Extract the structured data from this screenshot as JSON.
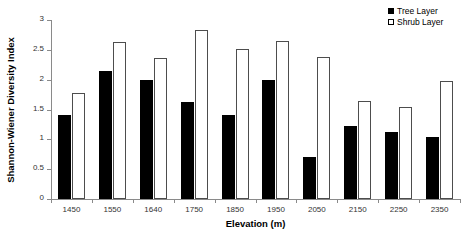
{
  "chart_data": {
    "type": "bar",
    "title": "",
    "xlabel": "Elevation (m)",
    "ylabel": "Shannon-Wiener Diversity Index",
    "categories": [
      "1450",
      "1550",
      "1640",
      "1750",
      "1850",
      "1950",
      "2050",
      "2150",
      "2250",
      "2350"
    ],
    "series": [
      {
        "name": "Tree Layer",
        "color": "#000000",
        "fill": "solid",
        "values": [
          1.4,
          2.15,
          2.0,
          1.62,
          1.4,
          2.0,
          0.71,
          1.23,
          1.12,
          1.04
        ]
      },
      {
        "name": "Shrub Layer",
        "color": "#ffffff",
        "fill": "open",
        "values": [
          1.77,
          2.63,
          2.36,
          2.83,
          2.51,
          2.65,
          2.38,
          1.64,
          1.55,
          1.97
        ]
      }
    ],
    "ylim": [
      0,
      3
    ],
    "ytick_labels": [
      "0",
      "0.5",
      "1",
      "1.5",
      "2",
      "2.5",
      "3"
    ],
    "ytick_values": [
      0,
      0.5,
      1,
      1.5,
      2,
      2.5,
      3
    ],
    "grid": false,
    "legend_position": "top-right"
  },
  "legend": {
    "entries": [
      {
        "label": "Tree Layer",
        "marker": "filled-square-icon"
      },
      {
        "label": "Shrub Layer",
        "marker": "open-square-icon"
      }
    ]
  }
}
